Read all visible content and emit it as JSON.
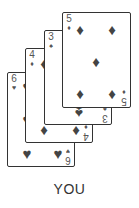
{
  "player_label": "YOU",
  "hand": [
    {
      "rank": "6",
      "suit": "♥",
      "suit_name": "hearts"
    },
    {
      "rank": "4",
      "suit": "♦",
      "suit_name": "diamonds"
    },
    {
      "rank": "3",
      "suit": "♠",
      "suit_name": "spades"
    },
    {
      "rank": "5",
      "suit": "♦",
      "suit_name": "diamonds"
    }
  ],
  "colors": {
    "card_border": "#333333",
    "ink": "#444444",
    "label": "#333333"
  }
}
